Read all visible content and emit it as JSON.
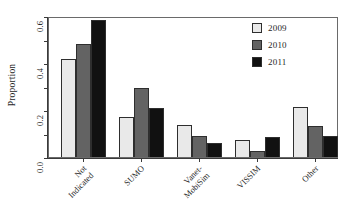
{
  "chart_data": {
    "type": "bar",
    "title": "",
    "subtitle": "",
    "xlabel": "",
    "ylabel": "Proportion",
    "categories": [
      "Not\nIndicated",
      "SUMO",
      "Vanet-\nMobiSim",
      "VISSIM",
      "Other"
    ],
    "category_labels_flat": [
      "Not Indicated",
      "SUMO",
      "Vanet-MobiSim",
      "VISSIM",
      "Other"
    ],
    "series": [
      {
        "name": "2009",
        "color": "#e9e9e9",
        "values": [
          0.415,
          0.172,
          0.138,
          0.072,
          0.212
        ]
      },
      {
        "name": "2010",
        "color": "#636363",
        "values": [
          0.482,
          0.295,
          0.091,
          0.026,
          0.131
        ]
      },
      {
        "name": "2011",
        "color": "#111111",
        "values": [
          0.585,
          0.207,
          0.06,
          0.086,
          0.09
        ]
      }
    ],
    "ylim": [
      0.0,
      0.6
    ],
    "ytick_values": [
      0.0,
      0.2,
      0.4,
      0.6
    ],
    "ytick_labels": [
      "0.0",
      "0.2",
      "0.4",
      "0.6"
    ],
    "yminor_tick_values": [
      0.1,
      0.3,
      0.5
    ],
    "grid": false,
    "legend_position": "top-right",
    "legend_entries": [
      "2009",
      "2010",
      "2011"
    ],
    "bar_border_color": "#2e2e2e",
    "axis_color": "#3a3a3a",
    "plot_frame": true,
    "background": "#ffffff"
  }
}
